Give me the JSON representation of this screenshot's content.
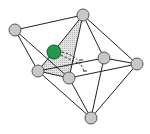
{
  "diagram": {
    "type": "polyhedron-coordination",
    "colors": {
      "node_fill": "#c8c8c8",
      "node_stroke": "#555555",
      "edge": "#222222",
      "shaded_face": "#d6d6d6",
      "dopant_fill": "#1f9a4a",
      "dopant_stroke": "#0d5a28"
    },
    "nodes": [
      {
        "id": "top",
        "x": 83,
        "y": 15,
        "r": 6
      },
      {
        "id": "left",
        "x": 15,
        "y": 30,
        "r": 6
      },
      {
        "id": "mid-right",
        "x": 104,
        "y": 58,
        "r": 6
      },
      {
        "id": "right",
        "x": 137,
        "y": 64,
        "r": 6
      },
      {
        "id": "lower-left",
        "x": 38,
        "y": 71,
        "r": 6
      },
      {
        "id": "lower-center",
        "x": 69,
        "y": 78,
        "r": 6
      },
      {
        "id": "bottom",
        "x": 91,
        "y": 118,
        "r": 6
      }
    ],
    "dopant": {
      "id": "green-atom",
      "x": 54,
      "y": 52,
      "r": 7
    },
    "edges": [
      [
        "top",
        "left"
      ],
      [
        "top",
        "right"
      ],
      [
        "top",
        "mid-right"
      ],
      [
        "top",
        "lower-left"
      ],
      [
        "top",
        "lower-center"
      ],
      [
        "left",
        "lower-left"
      ],
      [
        "left",
        "lower-center"
      ],
      [
        "right",
        "mid-right"
      ],
      [
        "right",
        "lower-center"
      ],
      [
        "right",
        "bottom"
      ],
      [
        "mid-right",
        "lower-left"
      ],
      [
        "mid-right",
        "bottom"
      ],
      [
        "lower-left",
        "lower-center"
      ],
      [
        "lower-left",
        "bottom"
      ],
      [
        "lower-center",
        "bottom"
      ]
    ],
    "shaded_face": [
      "top",
      "lower-left",
      "lower-center"
    ],
    "angle_marker": {
      "cx": 54,
      "cy": 52,
      "label": ""
    }
  }
}
